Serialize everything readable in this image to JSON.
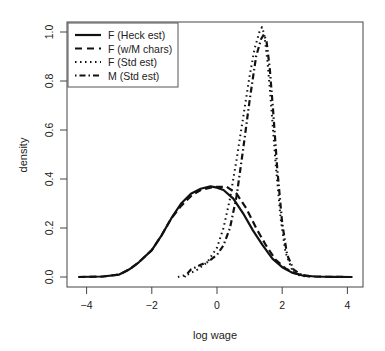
{
  "chart_data": {
    "type": "line",
    "title": "",
    "xlabel": "log wage",
    "ylabel": "density",
    "xlim": [
      -4.6,
      4.45
    ],
    "ylim": [
      -0.04,
      1.04
    ],
    "xticks": [
      -4,
      -2,
      0,
      2,
      4
    ],
    "xtick_labels": [
      "−4",
      "−2",
      "0",
      "2",
      "4"
    ],
    "yticks": [
      0.0,
      0.2,
      0.4,
      0.6,
      0.8,
      1.0
    ],
    "ytick_labels": [
      "0.0",
      "0.2",
      "0.4",
      "0.6",
      "0.8",
      "1.0"
    ],
    "grid": false,
    "legend_position": "top-left",
    "series": [
      {
        "name": "F (Heck est)",
        "style": "solid",
        "x": [
          -4.25,
          -3.5,
          -3.0,
          -2.7,
          -2.4,
          -2.0,
          -1.7,
          -1.4,
          -1.1,
          -0.8,
          -0.5,
          -0.2,
          0.0,
          0.2,
          0.5,
          0.8,
          1.1,
          1.4,
          1.7,
          2.0,
          2.3,
          2.6,
          3.0,
          3.5,
          4.15
        ],
        "y": [
          0.0,
          0.002,
          0.01,
          0.03,
          0.06,
          0.11,
          0.17,
          0.24,
          0.3,
          0.34,
          0.36,
          0.37,
          0.365,
          0.355,
          0.32,
          0.26,
          0.19,
          0.13,
          0.075,
          0.04,
          0.018,
          0.007,
          0.002,
          0.0005,
          0.0
        ]
      },
      {
        "name": "F (w/M chars)",
        "style": "dashed",
        "x": [
          -4.25,
          -3.5,
          -3.0,
          -2.7,
          -2.4,
          -2.0,
          -1.7,
          -1.4,
          -1.1,
          -0.8,
          -0.5,
          -0.2,
          0.0,
          0.3,
          0.6,
          0.9,
          1.2,
          1.5,
          1.8,
          2.1,
          2.4,
          2.7,
          3.0,
          3.5,
          4.15
        ],
        "y": [
          0.0,
          0.002,
          0.01,
          0.03,
          0.06,
          0.11,
          0.17,
          0.24,
          0.29,
          0.33,
          0.355,
          0.365,
          0.368,
          0.368,
          0.34,
          0.28,
          0.2,
          0.13,
          0.07,
          0.035,
          0.015,
          0.006,
          0.002,
          0.0005,
          0.0
        ]
      },
      {
        "name": "F (Std est)",
        "style": "dotted",
        "x": [
          -1.2,
          -0.9,
          -0.6,
          -0.3,
          0.0,
          0.2,
          0.4,
          0.6,
          0.8,
          1.0,
          1.15,
          1.3,
          1.38,
          1.45,
          1.55,
          1.65,
          1.8,
          1.95,
          2.1,
          2.3,
          2.5,
          2.8
        ],
        "y": [
          0.0,
          0.01,
          0.03,
          0.06,
          0.12,
          0.2,
          0.32,
          0.48,
          0.65,
          0.82,
          0.93,
          1.0,
          1.02,
          0.99,
          0.88,
          0.72,
          0.46,
          0.24,
          0.1,
          0.03,
          0.008,
          0.0
        ]
      },
      {
        "name": "M (Std est)",
        "style": "dashdot",
        "x": [
          -1.0,
          -0.8,
          -0.5,
          -0.3,
          0.0,
          0.2,
          0.4,
          0.6,
          0.8,
          1.0,
          1.2,
          1.35,
          1.44,
          1.52,
          1.62,
          1.72,
          1.85,
          2.0,
          2.15,
          2.35,
          2.6,
          2.9
        ],
        "y": [
          0.0,
          0.03,
          0.05,
          0.06,
          0.09,
          0.13,
          0.2,
          0.33,
          0.52,
          0.72,
          0.9,
          0.97,
          0.99,
          0.96,
          0.85,
          0.68,
          0.44,
          0.22,
          0.09,
          0.03,
          0.008,
          0.0
        ]
      }
    ]
  }
}
